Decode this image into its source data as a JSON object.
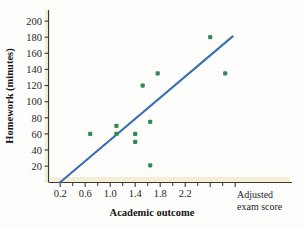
{
  "chart_data": {
    "type": "scatter",
    "title": "",
    "xlabel": "Academic outcome",
    "ylabel": "Homework (minutes)",
    "x_tick_labels": [
      "0.2",
      "0.6",
      "1.0",
      "1.4",
      "1.8",
      "2.2"
    ],
    "x_ticks": [
      0.2,
      0.6,
      1.0,
      1.4,
      1.8,
      2.2
    ],
    "x_minor_ticks": [
      0.4,
      0.8,
      1.2,
      1.6,
      2.0,
      2.4
    ],
    "y_tick_labels": [
      "20",
      "40",
      "60",
      "80",
      "100",
      "120",
      "140",
      "160",
      "180",
      "200"
    ],
    "y_ticks": [
      20,
      40,
      60,
      80,
      100,
      120,
      140,
      160,
      180,
      200
    ],
    "xlim": [
      0.0,
      2.6
    ],
    "ylim": [
      0,
      212
    ],
    "grid": false,
    "legend": false,
    "corner_annotation": "Adjusted exam score",
    "corner_annotation_line1": "Adjusted",
    "corner_annotation_line2": "exam score",
    "marker_color": "#2f8a57",
    "marker_shape": "square",
    "points": [
      {
        "x": 0.6,
        "y": 60
      },
      {
        "x": 0.95,
        "y": 70
      },
      {
        "x": 0.95,
        "y": 60
      },
      {
        "x": 1.2,
        "y": 60
      },
      {
        "x": 1.2,
        "y": 50
      },
      {
        "x": 1.3,
        "y": 120
      },
      {
        "x": 1.4,
        "y": 75
      },
      {
        "x": 1.4,
        "y": 21
      },
      {
        "x": 1.5,
        "y": 135
      },
      {
        "x": 2.2,
        "y": 180
      },
      {
        "x": 2.4,
        "y": 135
      }
    ],
    "trend_line": {
      "type": "line",
      "color": "#3b6fb0",
      "x_start": 0.2,
      "y_start": 0,
      "x_end": 2.5,
      "y_end": 181
    },
    "axis_color": "#3a3a3a",
    "axis_band_color": "#f4ead4"
  }
}
